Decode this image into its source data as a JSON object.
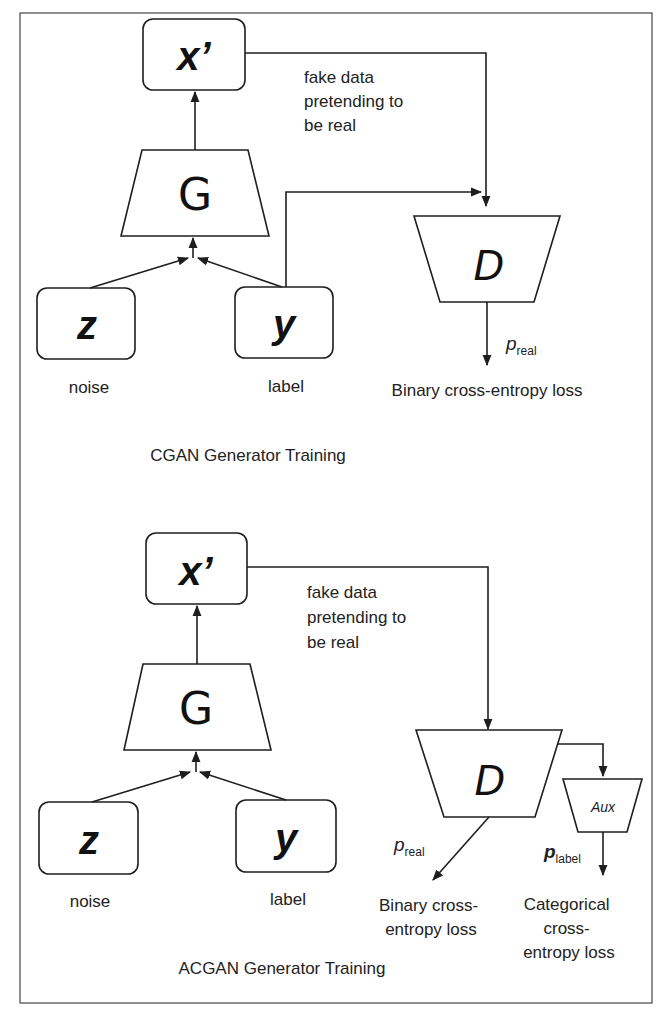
{
  "diagram": {
    "panels": [
      {
        "id": "cgan",
        "title": "CGAN Generator Training",
        "nodes": {
          "x_prime": "x’",
          "generator": "G",
          "noise_symbol": "z",
          "label_symbol": "y",
          "discriminator": "D"
        },
        "labels": {
          "noise": "noise",
          "label": "label",
          "fake_line1": "fake data",
          "fake_line2": "pretending to",
          "fake_line3": "be real",
          "p_real_var": "p",
          "p_real_sub": "real",
          "loss": "Binary cross-entropy loss"
        }
      },
      {
        "id": "acgan",
        "title": "ACGAN Generator Training",
        "nodes": {
          "x_prime": "x’",
          "generator": "G",
          "noise_symbol": "z",
          "label_symbol": "y",
          "discriminator": "D",
          "auxiliary": "Aux"
        },
        "labels": {
          "noise": "noise",
          "label": "label",
          "fake_line1": "fake data",
          "fake_line2": "pretending to",
          "fake_line3": "be real",
          "p_real_var": "p",
          "p_real_sub": "real",
          "p_label_var": "p",
          "p_label_sub": "label",
          "binary_loss_line1": "Binary cross-",
          "binary_loss_line2": "entropy loss",
          "cat_loss_line1": "Categorical",
          "cat_loss_line2": "cross-",
          "cat_loss_line3": "entropy loss"
        }
      }
    ]
  }
}
